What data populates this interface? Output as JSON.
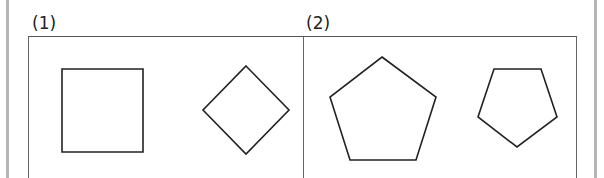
{
  "panels": [
    {
      "label": "(1)",
      "shapes": [
        {
          "type": "square",
          "points": "62,69 143,69 143,152 62,152"
        },
        {
          "type": "diamond",
          "points": "246,66 289,110 246,154 203,110"
        }
      ]
    },
    {
      "label": "(2)",
      "shapes": [
        {
          "type": "regular-pentagon-large",
          "points": "382,57 436,97 416,160 350,160 330,97"
        },
        {
          "type": "pentagon-small-rotated",
          "points": "494,69 541,69 557,117 517,147 478,117"
        }
      ]
    }
  ],
  "colors": {
    "stroke": "#222222",
    "frame": "#666666",
    "side_bar": "#b5b5b5"
  }
}
